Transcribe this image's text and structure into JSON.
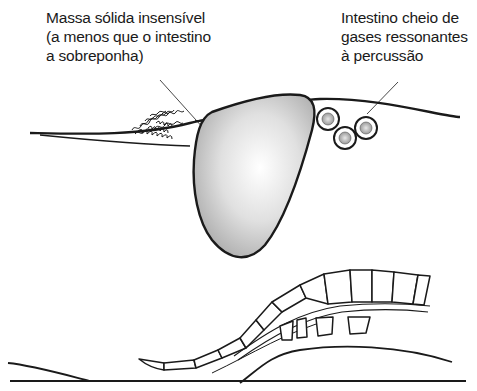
{
  "labels": {
    "solid_mass": {
      "lines": [
        "Massa sólida insensível",
        "(a menos que o intestino",
        "a sobreponha)"
      ]
    },
    "gas_bowel": {
      "lines": [
        "Intestino cheio de",
        "gases ressonantes",
        "à percussão"
      ]
    }
  },
  "colors": {
    "ink": "#1a1a1a",
    "mass_fill_center": "#ffffff",
    "mass_fill_edge": "#b8b8b8",
    "bubble_fill": "#c4c4c4"
  }
}
